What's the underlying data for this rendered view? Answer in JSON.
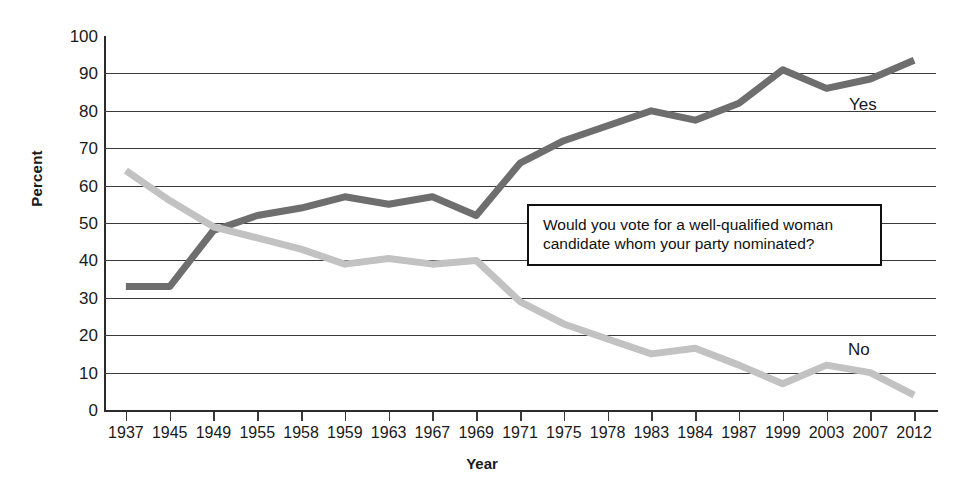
{
  "chart_data": {
    "type": "line",
    "title": "",
    "xlabel": "Year",
    "ylabel": "Percent",
    "ylim": [
      0,
      100
    ],
    "ytick_step": 10,
    "grid": true,
    "legend_position": "inline-right",
    "annotations": [
      "Would you vote for a well-qualified woman candidate whom your party nominated?"
    ],
    "categories": [
      "1937",
      "1945",
      "1949",
      "1955",
      "1958",
      "1959",
      "1963",
      "1967",
      "1969",
      "1971",
      "1975",
      "1978",
      "1983",
      "1984",
      "1987",
      "1999",
      "2003",
      "2007",
      "2012"
    ],
    "yticks": [
      "0",
      "10",
      "20",
      "30",
      "40",
      "50",
      "60",
      "70",
      "80",
      "90",
      "100"
    ],
    "series": [
      {
        "name": "Yes",
        "color": "#6e6e6e",
        "values": [
          33,
          33,
          48,
          52,
          54,
          57,
          55,
          57,
          52,
          66,
          72,
          76,
          80,
          77.5,
          82,
          91,
          86,
          88.5,
          93.5
        ]
      },
      {
        "name": "No",
        "color": "#c2c2c2",
        "values": [
          64,
          56,
          49,
          46,
          43,
          39,
          40.5,
          39,
          40,
          29,
          23,
          19,
          15,
          16.5,
          12,
          7,
          12,
          10,
          4
        ]
      }
    ]
  },
  "question": {
    "line1": "Would you vote for a well-qualified woman",
    "line2": "candidate whom your party nominated?"
  },
  "labels": {
    "yes": "Yes",
    "no": "No",
    "x_axis_title": "Year",
    "y_axis_title": "Percent"
  }
}
